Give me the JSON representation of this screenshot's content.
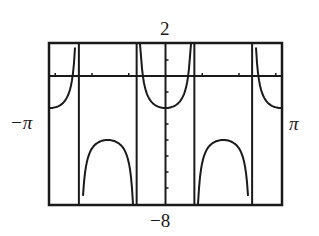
{
  "chart_data": {
    "type": "line",
    "title": "",
    "function_hint": "y = sec(2x) - 3",
    "xlabel": "",
    "ylabel": "",
    "xlim": [
      -3.14159,
      3.14159
    ],
    "ylim": [
      -8,
      2
    ],
    "x_tick_labels": {
      "min": "−π",
      "max": "π"
    },
    "y_tick_labels": {
      "max": "2",
      "min": "−8"
    },
    "grid": false,
    "asymptotes_x": [
      -2.356,
      -0.785,
      0.785,
      2.356
    ],
    "series": [
      {
        "name": "curve",
        "points": [
          [
            -3.14,
            -2.0
          ],
          [
            -2.9,
            -1.87
          ],
          [
            -2.7,
            -1.3
          ],
          [
            -2.5,
            0.5
          ],
          [
            -2.2,
            -6.2
          ],
          [
            -2.0,
            -4.4
          ],
          [
            -1.8,
            -4.1
          ],
          [
            -1.57,
            -4.0
          ],
          [
            -1.3,
            -4.1
          ],
          [
            -1.1,
            -4.4
          ],
          [
            -0.95,
            -6.2
          ],
          [
            -0.7,
            2.0
          ],
          [
            -0.6,
            0.0
          ],
          [
            -0.4,
            -1.6
          ],
          [
            -0.2,
            -1.92
          ],
          [
            0.0,
            -2.0
          ],
          [
            0.2,
            -1.92
          ],
          [
            0.4,
            -1.6
          ],
          [
            0.6,
            0.0
          ],
          [
            0.7,
            2.0
          ],
          [
            0.95,
            -6.2
          ],
          [
            1.1,
            -4.4
          ],
          [
            1.3,
            -4.1
          ],
          [
            1.57,
            -4.0
          ],
          [
            1.8,
            -4.1
          ],
          [
            2.0,
            -4.4
          ],
          [
            2.2,
            -6.2
          ],
          [
            2.5,
            0.5
          ],
          [
            2.7,
            -1.3
          ],
          [
            2.9,
            -1.87
          ],
          [
            3.14,
            -2.0
          ]
        ]
      }
    ]
  },
  "labels": {
    "y_max": "2",
    "y_min": "−8",
    "x_min": "−π",
    "x_max": "π"
  }
}
